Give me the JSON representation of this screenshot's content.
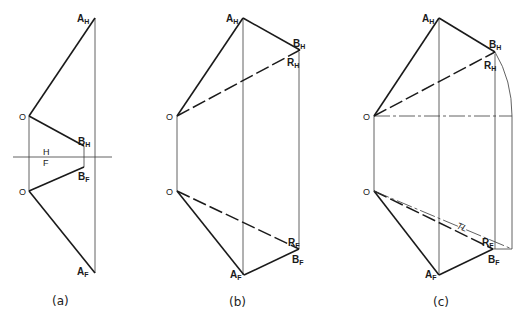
{
  "figure": {
    "panels": [
      {
        "caption": "(a)",
        "labels": {
          "a_h": {
            "main": "A",
            "sub": "H"
          },
          "b_h": {
            "main": "B",
            "sub": "H"
          },
          "b_f": {
            "main": "B",
            "sub": "F"
          },
          "a_f": {
            "main": "A",
            "sub": "F"
          },
          "o_top": "O",
          "o_bottom": "O",
          "fold_h": "H",
          "fold_f": "F"
        }
      },
      {
        "caption": "(b)",
        "labels": {
          "a_h": {
            "main": "A",
            "sub": "H"
          },
          "b_h": {
            "main": "B",
            "sub": "H"
          },
          "r_h": {
            "main": "R",
            "sub": "H"
          },
          "r_f": {
            "main": "R",
            "sub": "F"
          },
          "b_f": {
            "main": "B",
            "sub": "F"
          },
          "a_f": {
            "main": "A",
            "sub": "F"
          },
          "o_top": "O",
          "o_bottom": "O"
        }
      },
      {
        "caption": "(c)",
        "labels": {
          "a_h": {
            "main": "A",
            "sub": "H"
          },
          "b_h": {
            "main": "B",
            "sub": "H"
          },
          "r_h": {
            "main": "R",
            "sub": "H"
          },
          "r_f": {
            "main": "R",
            "sub": "F"
          },
          "b_f": {
            "main": "B",
            "sub": "F"
          },
          "a_f": {
            "main": "A",
            "sub": "F"
          },
          "o_top": "O",
          "o_bottom": "O",
          "true_length": "TL"
        }
      }
    ]
  }
}
